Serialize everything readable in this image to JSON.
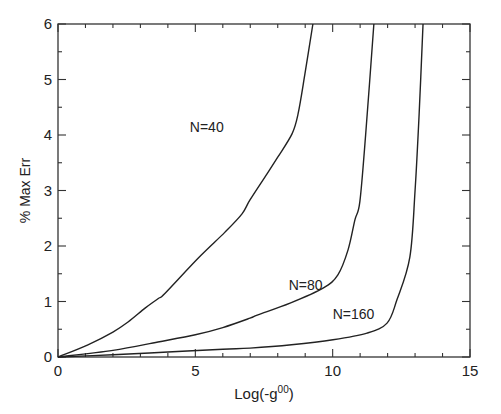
{
  "chart_data": {
    "type": "line",
    "title": "",
    "xlabel": "Log(-g",
    "xlabel_superscript": "00",
    "xlabel_suffix": ")",
    "ylabel": "% Max Err",
    "xlim": [
      0,
      15
    ],
    "ylim": [
      0,
      6
    ],
    "x_ticks": [
      0,
      5,
      10,
      15
    ],
    "x_tick_labels": [
      "0",
      "5",
      "10",
      "15"
    ],
    "x_minor_step": 1,
    "y_ticks": [
      0,
      1,
      2,
      3,
      4,
      5,
      6
    ],
    "y_tick_labels": [
      "0",
      "1",
      "2",
      "3",
      "4",
      "5",
      "6"
    ],
    "y_minor_step": 0.5,
    "grid": false,
    "legend": "none",
    "series": [
      {
        "name": "N=40",
        "x": [
          0,
          1.09,
          2.0,
          2.55,
          3.17,
          3.64,
          3.9,
          5.1,
          6.08,
          6.7,
          6.99,
          7.61,
          8.0,
          8.52,
          8.74,
          8.99,
          9.28
        ],
        "y": [
          0,
          0.22,
          0.45,
          0.63,
          0.88,
          1.05,
          1.15,
          1.78,
          2.25,
          2.58,
          2.83,
          3.3,
          3.6,
          4.02,
          4.38,
          5.1,
          6.0
        ]
      },
      {
        "name": "N=80",
        "x": [
          0,
          2.0,
          3.64,
          5.0,
          6.0,
          6.99,
          7.28,
          8.45,
          9.65,
          10.19,
          10.56,
          10.81,
          10.99,
          11.2,
          11.5
        ],
        "y": [
          0,
          0.12,
          0.27,
          0.4,
          0.53,
          0.7,
          0.76,
          0.97,
          1.24,
          1.48,
          1.93,
          2.47,
          2.8,
          4.0,
          6.0
        ]
      },
      {
        "name": "N=160",
        "x": [
          0,
          2.0,
          4.0,
          6.0,
          6.99,
          8.5,
          10.01,
          11.25,
          11.98,
          12.34,
          12.81,
          13.0,
          13.15,
          13.29
        ],
        "y": [
          0,
          0.04,
          0.09,
          0.14,
          0.16,
          0.22,
          0.31,
          0.43,
          0.61,
          1.03,
          1.8,
          3.0,
          4.4,
          6.0
        ]
      }
    ],
    "annotations": [
      {
        "text": "N=40",
        "x": 4.8,
        "y": 4.05
      },
      {
        "text": "N=80",
        "x": 8.4,
        "y": 1.2
      },
      {
        "text": "N=160",
        "x": 10.0,
        "y": 0.68
      }
    ]
  }
}
